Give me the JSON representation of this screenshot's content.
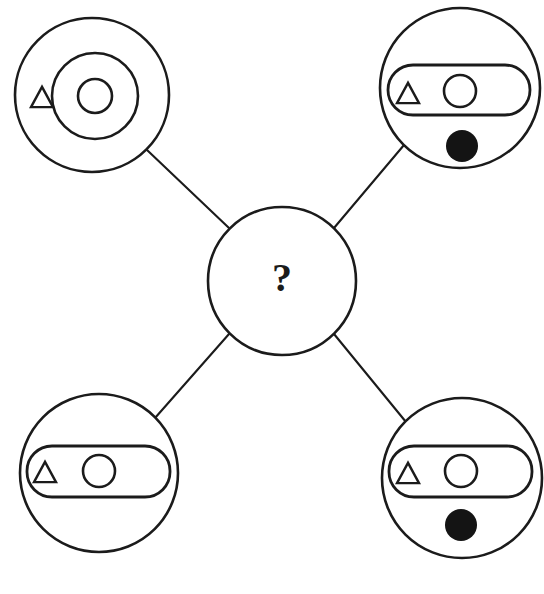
{
  "canvas": {
    "width": 544,
    "height": 594,
    "background": "#ffffff",
    "stroke_color": "#1b1b1b",
    "fill_color": "#141414",
    "title": "Four-node radial diagram with unknown center"
  },
  "center_node": {
    "id": "center-node",
    "label": "?",
    "cx": 282,
    "cy": 281,
    "r": 74,
    "description": "unknown-element-placeholder"
  },
  "nodes": [
    {
      "id": "node-top-left",
      "position": "top-left",
      "cx": 92,
      "cy": 95,
      "r": 77,
      "contents": {
        "triangle": {
          "present": true,
          "cx": 42,
          "cy": 97,
          "size": 22,
          "fill": "hollow"
        },
        "ring": {
          "present": true,
          "cx": 95,
          "cy": 96,
          "r": 43,
          "fill": "hollow"
        },
        "inner_circle": {
          "present": true,
          "cx": 95,
          "cy": 96,
          "r": 17,
          "fill": "hollow"
        },
        "pill": {
          "present": false
        },
        "filled_dot": {
          "present": false
        }
      }
    },
    {
      "id": "node-top-right",
      "position": "top-right",
      "cx": 460,
      "cy": 88,
      "r": 80,
      "contents": {
        "triangle": {
          "present": true,
          "cx": 408,
          "cy": 93,
          "size": 22,
          "fill": "hollow"
        },
        "ring": {
          "present": false
        },
        "inner_circle": {
          "present": true,
          "cx": 460,
          "cy": 91,
          "r": 16,
          "fill": "hollow"
        },
        "pill": {
          "present": true,
          "x": 388,
          "y": 65,
          "width": 142,
          "height": 50,
          "radius": 25
        },
        "filled_dot": {
          "present": true,
          "cx": 462,
          "cy": 146,
          "r": 16
        }
      }
    },
    {
      "id": "node-bottom-left",
      "position": "bottom-left",
      "cx": 99,
      "cy": 473,
      "r": 79,
      "contents": {
        "triangle": {
          "present": true,
          "cx": 45,
          "cy": 472,
          "size": 22,
          "fill": "hollow"
        },
        "ring": {
          "present": false
        },
        "inner_circle": {
          "present": true,
          "cx": 99,
          "cy": 471,
          "r": 16,
          "fill": "hollow"
        },
        "pill": {
          "present": true,
          "x": 27,
          "y": 446,
          "width": 143,
          "height": 51,
          "radius": 25
        },
        "filled_dot": {
          "present": false
        }
      }
    },
    {
      "id": "node-bottom-right",
      "position": "bottom-right",
      "cx": 462,
      "cy": 478,
      "r": 80,
      "contents": {
        "triangle": {
          "present": true,
          "cx": 408,
          "cy": 473,
          "size": 22,
          "fill": "hollow"
        },
        "ring": {
          "present": false
        },
        "inner_circle": {
          "present": true,
          "cx": 461,
          "cy": 471,
          "r": 16,
          "fill": "hollow"
        },
        "pill": {
          "present": true,
          "x": 389,
          "y": 446,
          "width": 143,
          "height": 51,
          "radius": 25
        },
        "filled_dot": {
          "present": true,
          "cx": 461,
          "cy": 525,
          "r": 16
        }
      }
    }
  ],
  "edges": [
    {
      "id": "edge-top-left",
      "from": "node-top-left",
      "to": "center-node",
      "x1": 147,
      "y1": 150,
      "x2": 229,
      "y2": 228
    },
    {
      "id": "edge-top-right",
      "from": "node-top-right",
      "to": "center-node",
      "x1": 404,
      "y1": 145,
      "x2": 334,
      "y2": 228
    },
    {
      "id": "edge-bottom-left",
      "from": "node-bottom-left",
      "to": "center-node",
      "x1": 155,
      "y1": 418,
      "x2": 229,
      "y2": 334
    },
    {
      "id": "edge-bottom-right",
      "from": "node-bottom-right",
      "to": "center-node",
      "x1": 406,
      "y1": 422,
      "x2": 334,
      "y2": 334
    }
  ]
}
